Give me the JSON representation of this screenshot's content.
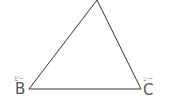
{
  "diagram": {
    "type": "triangle",
    "stroke_color": "#333333",
    "vertices": [
      {
        "id": "apex",
        "x": 97,
        "y": 0,
        "label": ""
      },
      {
        "id": "B",
        "x": 29,
        "y": 89,
        "label": "B",
        "reading": "ビー"
      },
      {
        "id": "C",
        "x": 141,
        "y": 89,
        "label": "C",
        "reading": "シー"
      }
    ]
  },
  "labels": {
    "B": {
      "text": "B",
      "ruby": "ビー"
    },
    "C": {
      "text": "C",
      "ruby": "シー"
    }
  }
}
